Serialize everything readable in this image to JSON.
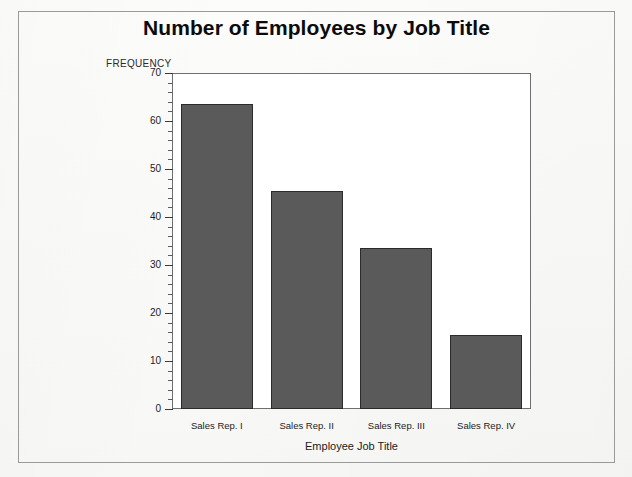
{
  "figure": {
    "title": "Number of Employees by Job Title",
    "background_color": "#fbfbfa",
    "border_color": "#9a9a9a"
  },
  "chart_data": {
    "type": "bar",
    "title": "Number of Employees by Job Title",
    "subtitle": "",
    "xlabel": "Employee Job Title",
    "ylabel": "FREQUENCY",
    "categories": [
      "Sales Rep. I",
      "Sales Rep. II",
      "Sales Rep. III",
      "Sales Rep. IV"
    ],
    "values": [
      63.5,
      45.5,
      33.5,
      15.5
    ],
    "ylim": [
      0,
      70
    ],
    "ytick_labels": [
      "0",
      "10",
      "20",
      "30",
      "40",
      "50",
      "60",
      "70"
    ],
    "ytick_values": [
      0,
      10,
      20,
      30,
      40,
      50,
      60,
      70
    ],
    "minor_tick_step": 2,
    "grid": false,
    "legend": null,
    "bar_color": "#5a5a5a",
    "bar_edge_color": "#2b2b2b",
    "axis_color": "#6f6f6f"
  }
}
